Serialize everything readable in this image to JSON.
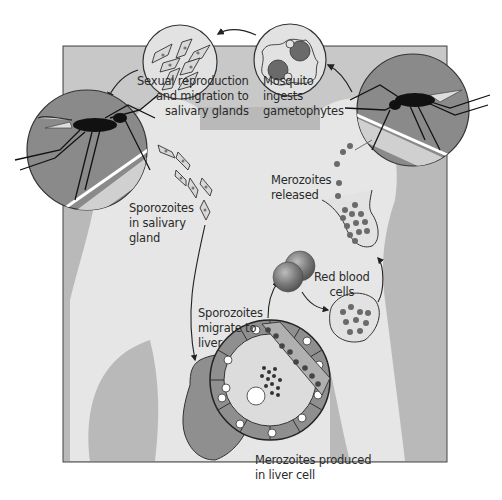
{
  "diagram": {
    "colors": {
      "background_panel": "#b9b9b9",
      "body_silhouette": "#e6e6e6",
      "circle_fill": "#e2e2e2",
      "mosquito_circle_dark": "#8a8a8a",
      "mosquito_circle_light": "#d0d0d0",
      "parasite_dark": "#6a6a6a",
      "liver": "#8f8f8f",
      "outline": "#333333",
      "text": "#2a2a2a"
    },
    "labels": {
      "sexual_reproduction": [
        "Sexual reproduction",
        "and migration to",
        "salivary glands"
      ],
      "mosquito_ingests": [
        "Mosquito",
        "ingests",
        "gametophytes"
      ],
      "sporozoites_salivary": [
        "Sporozoites",
        "in salivary",
        "gland"
      ],
      "merozoites_released": [
        "Merozoites",
        "released"
      ],
      "red_blood_cells": [
        "Red blood",
        "cells"
      ],
      "sporozoites_migrate": [
        "Sporozoites",
        "migrate to",
        "liver"
      ],
      "merozoites_produced": [
        "Merozoites produced",
        "in liver cell"
      ]
    },
    "stages": [
      {
        "id": "mosquito-bite-left",
        "description": "Mosquito injects sporozoites"
      },
      {
        "id": "sporozoites-salivary",
        "description": "Sporozoites in salivary gland"
      },
      {
        "id": "liver-stage",
        "description": "Sporozoites migrate to liver; merozoites produced in liver cell"
      },
      {
        "id": "rbc-stage",
        "description": "Red blood cells infected; merozoites released"
      },
      {
        "id": "mosquito-bite-right",
        "description": "Mosquito ingests gametophytes"
      },
      {
        "id": "sexual-stage",
        "description": "Sexual reproduction and migration to salivary glands"
      }
    ]
  }
}
